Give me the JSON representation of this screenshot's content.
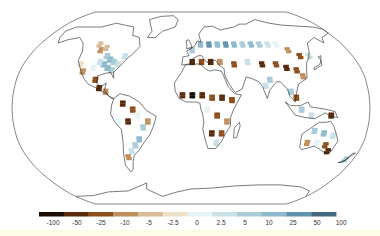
{
  "map": {
    "projection": "robinson",
    "frame_color": "#555555",
    "coast_color": "#222222",
    "cells": [
      {
        "lon": -110,
        "lat": 55,
        "bin": 4
      },
      {
        "lon": -105,
        "lat": 50,
        "bin": 3
      },
      {
        "lon": -100,
        "lat": 52,
        "bin": 4
      },
      {
        "lon": -95,
        "lat": 45,
        "bin": 8
      },
      {
        "lon": -90,
        "lat": 42,
        "bin": 9
      },
      {
        "lon": -85,
        "lat": 40,
        "bin": 8
      },
      {
        "lon": -80,
        "lat": 38,
        "bin": 7
      },
      {
        "lon": -95,
        "lat": 38,
        "bin": 9
      },
      {
        "lon": -100,
        "lat": 40,
        "bin": 7
      },
      {
        "lon": -105,
        "lat": 35,
        "bin": 6
      },
      {
        "lon": -85,
        "lat": 33,
        "bin": 8
      },
      {
        "lon": -90,
        "lat": 35,
        "bin": 9
      },
      {
        "lon": -120,
        "lat": 38,
        "bin": 5
      },
      {
        "lon": -115,
        "lat": 32,
        "bin": 3
      },
      {
        "lon": -100,
        "lat": 25,
        "bin": 2
      },
      {
        "lon": -95,
        "lat": 18,
        "bin": 1
      },
      {
        "lon": -88,
        "lat": 15,
        "bin": 3
      },
      {
        "lon": -75,
        "lat": 45,
        "bin": 7
      },
      {
        "lon": -70,
        "lat": 5,
        "bin": 1
      },
      {
        "lon": -60,
        "lat": 0,
        "bin": 2
      },
      {
        "lon": -55,
        "lat": -5,
        "bin": 6
      },
      {
        "lon": -65,
        "lat": -10,
        "bin": 1
      },
      {
        "lon": -50,
        "lat": -15,
        "bin": 8
      },
      {
        "lon": -55,
        "lat": -25,
        "bin": 9
      },
      {
        "lon": -60,
        "lat": -30,
        "bin": 8
      },
      {
        "lon": -65,
        "lat": -35,
        "bin": 7
      },
      {
        "lon": -70,
        "lat": -40,
        "bin": 3
      },
      {
        "lon": -45,
        "lat": -10,
        "bin": 3
      },
      {
        "lon": -75,
        "lat": -10,
        "bin": 6
      },
      {
        "lon": 0,
        "lat": 50,
        "bin": 8
      },
      {
        "lon": 10,
        "lat": 55,
        "bin": 9
      },
      {
        "lon": 20,
        "lat": 55,
        "bin": 10
      },
      {
        "lon": 30,
        "lat": 55,
        "bin": 9
      },
      {
        "lon": 40,
        "lat": 55,
        "bin": 10
      },
      {
        "lon": 50,
        "lat": 55,
        "bin": 9
      },
      {
        "lon": 60,
        "lat": 55,
        "bin": 8
      },
      {
        "lon": 70,
        "lat": 55,
        "bin": 9
      },
      {
        "lon": 80,
        "lat": 55,
        "bin": 8
      },
      {
        "lon": 90,
        "lat": 55,
        "bin": 7
      },
      {
        "lon": 100,
        "lat": 55,
        "bin": 6
      },
      {
        "lon": 110,
        "lat": 50,
        "bin": 3
      },
      {
        "lon": 120,
        "lat": 45,
        "bin": 2
      },
      {
        "lon": 130,
        "lat": 45,
        "bin": 7
      },
      {
        "lon": 0,
        "lat": 40,
        "bin": 1
      },
      {
        "lon": 10,
        "lat": 40,
        "bin": 2
      },
      {
        "lon": 20,
        "lat": 40,
        "bin": 1
      },
      {
        "lon": 30,
        "lat": 40,
        "bin": 3
      },
      {
        "lon": 45,
        "lat": 38,
        "bin": 2
      },
      {
        "lon": 60,
        "lat": 40,
        "bin": 7
      },
      {
        "lon": 75,
        "lat": 38,
        "bin": 1
      },
      {
        "lon": 90,
        "lat": 38,
        "bin": 2
      },
      {
        "lon": 100,
        "lat": 35,
        "bin": 1
      },
      {
        "lon": 110,
        "lat": 33,
        "bin": 2
      },
      {
        "lon": 115,
        "lat": 28,
        "bin": 3
      },
      {
        "lon": 80,
        "lat": 25,
        "bin": 8
      },
      {
        "lon": 75,
        "lat": 20,
        "bin": 7
      },
      {
        "lon": 100,
        "lat": 15,
        "bin": 8
      },
      {
        "lon": 105,
        "lat": 10,
        "bin": 2
      },
      {
        "lon": 110,
        "lat": 0,
        "bin": 8
      },
      {
        "lon": 120,
        "lat": -5,
        "bin": 7
      },
      {
        "lon": 140,
        "lat": -5,
        "bin": 1
      },
      {
        "lon": -10,
        "lat": 12,
        "bin": 1
      },
      {
        "lon": 0,
        "lat": 12,
        "bin": 0
      },
      {
        "lon": 10,
        "lat": 12,
        "bin": 1
      },
      {
        "lon": 20,
        "lat": 10,
        "bin": 2
      },
      {
        "lon": 30,
        "lat": 10,
        "bin": 1
      },
      {
        "lon": 40,
        "lat": 8,
        "bin": 2
      },
      {
        "lon": 15,
        "lat": 0,
        "bin": 6
      },
      {
        "lon": 25,
        "lat": -5,
        "bin": 2
      },
      {
        "lon": 35,
        "lat": -10,
        "bin": 3
      },
      {
        "lon": 20,
        "lat": -20,
        "bin": 1
      },
      {
        "lon": 30,
        "lat": -20,
        "bin": 2
      },
      {
        "lon": 25,
        "lat": -28,
        "bin": 7
      },
      {
        "lon": 125,
        "lat": -18,
        "bin": 8
      },
      {
        "lon": 135,
        "lat": -20,
        "bin": 9
      },
      {
        "lon": 145,
        "lat": -22,
        "bin": 7
      },
      {
        "lon": 130,
        "lat": -28,
        "bin": 6
      },
      {
        "lon": 140,
        "lat": -30,
        "bin": 2
      },
      {
        "lon": 145,
        "lat": -35,
        "bin": 1
      },
      {
        "lon": 120,
        "lat": -28,
        "bin": 3
      },
      {
        "lon": 170,
        "lat": -42,
        "bin": 8
      }
    ]
  },
  "colorbar": {
    "ticks": [
      "-100",
      "-50",
      "-25",
      "-10",
      "-5",
      "-2.5",
      "0",
      "2.5",
      "5",
      "10",
      "25",
      "50",
      "100"
    ],
    "colors": [
      "#1a0d05",
      "#5a2a0c",
      "#8c4f1c",
      "#c09060",
      "#d9bb96",
      "#efe0c8",
      "#e6f4f5",
      "#c8e0e6",
      "#a9cbd8",
      "#8db9cc",
      "#5f93ad",
      "#43697e"
    ]
  }
}
